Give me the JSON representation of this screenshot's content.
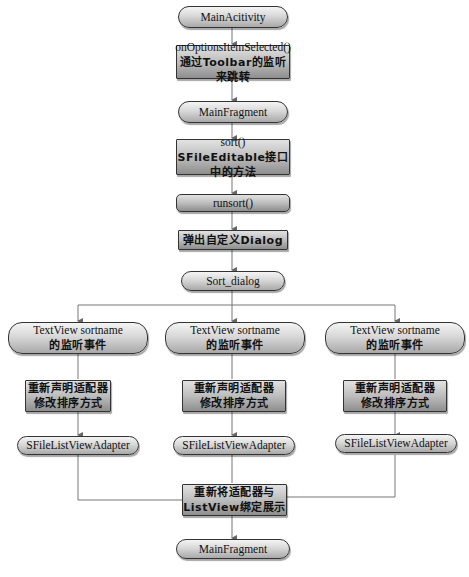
{
  "diagram": {
    "type": "flowchart",
    "nodes": {
      "main_activity": "MainAcitivity",
      "on_options": {
        "line1": "onOptionsItemSelected()",
        "line2": "通过Toolbar的监听来跳转"
      },
      "main_fragment_top": "MainFragment",
      "sort": {
        "line1": "sort()",
        "line2": "SFileEditable接口中的方法"
      },
      "runsort": "runsort()",
      "popup_dialog": "弹出自定义Dialog",
      "sort_dialog": "Sort_dialog",
      "branches": [
        {
          "listener": {
            "line1": "TextView sortname",
            "line2": "的监听事件"
          },
          "redeclare": {
            "line1": "重新声明适配器",
            "line2": "修改排序方式"
          },
          "adapter": "SFileListViewAdapter"
        },
        {
          "listener": {
            "line1": "TextView sortname",
            "line2": "的监听事件"
          },
          "redeclare": {
            "line1": "重新声明适配器",
            "line2": "修改排序方式"
          },
          "adapter": "SFileListViewAdapter"
        },
        {
          "listener": {
            "line1": "TextView sortname",
            "line2": "的监听事件"
          },
          "redeclare": {
            "line1": "重新声明适配器",
            "line2": "修改排序方式"
          },
          "adapter": "SFileListViewAdapter"
        }
      ],
      "rebind": {
        "line1": "重新将适配器与",
        "line2": "ListView绑定展示"
      },
      "main_fragment_bottom": "MainFragment"
    },
    "colors": {
      "line": "#6a6a6a",
      "border": "#333333",
      "fill_light": "#f4f4f4",
      "fill_dark": "#a9a9a9"
    }
  }
}
